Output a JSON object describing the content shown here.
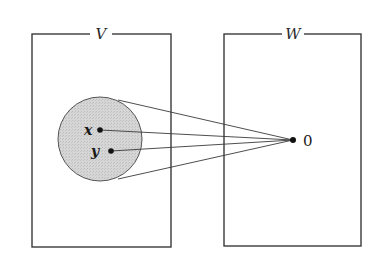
{
  "diagram": {
    "colors": {
      "stroke": "#3a3a3a",
      "ball_fill": "#d4d4d4",
      "dot": "#111111",
      "background": "#ffffff"
    },
    "spaces": [
      {
        "id": "V",
        "label": "V",
        "box": {
          "x": 32,
          "y": 34,
          "width": 139,
          "height": 213
        },
        "label_pos": {
          "x": 101,
          "y": 39
        }
      },
      {
        "id": "W",
        "label": "W",
        "box": {
          "x": 224,
          "y": 34,
          "width": 137,
          "height": 212
        },
        "label_pos": {
          "x": 293,
          "y": 39
        }
      }
    ],
    "ball": {
      "cx": 100,
      "cy": 139,
      "r": 42,
      "tangent_top": {
        "x": 118,
        "y": 100
      },
      "tangent_bottom": {
        "x": 118,
        "y": 179
      }
    },
    "points": [
      {
        "id": "x",
        "label": "x",
        "x": 100,
        "y": 130,
        "label_x": 84,
        "label_y": 135
      },
      {
        "id": "y",
        "label": "y",
        "x": 111,
        "y": 151,
        "label_x": 91,
        "label_y": 156
      }
    ],
    "target": {
      "label": "0",
      "x": 293,
      "y": 140,
      "label_x": 303,
      "label_y": 146
    }
  }
}
